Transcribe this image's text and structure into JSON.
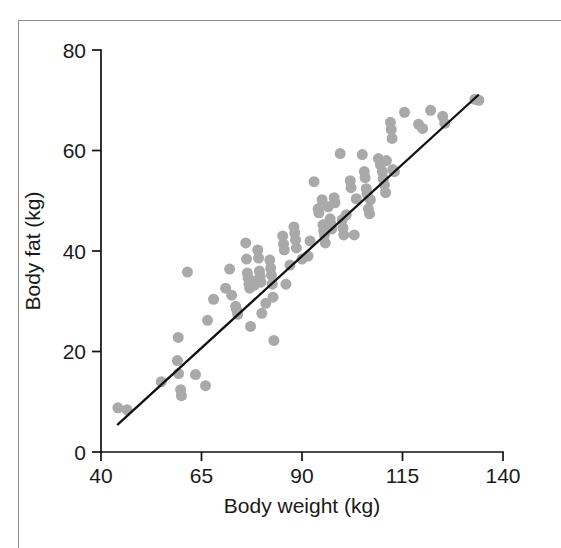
{
  "figure": {
    "background_color": "#ffffff",
    "frame_color": "#8c8c8c",
    "axis_color": "#111111"
  },
  "chart_data": {
    "type": "scatter",
    "title": "",
    "subtitle": "",
    "xlabel": "Body weight (kg)",
    "ylabel": "Body fat (kg)",
    "xlim": [
      40,
      140
    ],
    "ylim": [
      0,
      80
    ],
    "xticks": [
      40,
      65,
      90,
      115,
      140
    ],
    "yticks": [
      0,
      20,
      40,
      60,
      80
    ],
    "xtick_labels": [
      "40",
      "65",
      "90",
      "115",
      "140"
    ],
    "ytick_labels": [
      "0",
      "20",
      "40",
      "60",
      "80"
    ],
    "grid": false,
    "legend": null,
    "legend_position": "none",
    "marker": {
      "shape": "circle",
      "color": "#a9a9a9",
      "size_px": 11,
      "edge": "none"
    },
    "annotations": [],
    "series": [
      {
        "name": "Subjects",
        "marker_color": "#a9a9a9",
        "n_points": 104,
        "points": [
          [
            44.2,
            8.8
          ],
          [
            46.5,
            8.4
          ],
          [
            55.0,
            14.0
          ],
          [
            59.0,
            18.2
          ],
          [
            59.2,
            22.8
          ],
          [
            59.3,
            15.6
          ],
          [
            59.8,
            12.4
          ],
          [
            60.0,
            11.2
          ],
          [
            63.5,
            15.4
          ],
          [
            66.0,
            13.2
          ],
          [
            66.5,
            26.2
          ],
          [
            72.0,
            36.4
          ],
          [
            72.5,
            31.2
          ],
          [
            73.5,
            29.0
          ],
          [
            73.8,
            28.2
          ],
          [
            74.0,
            27.4
          ],
          [
            76.0,
            41.6
          ],
          [
            76.2,
            38.4
          ],
          [
            76.4,
            35.6
          ],
          [
            76.6,
            34.6
          ],
          [
            76.8,
            33.4
          ],
          [
            77.0,
            32.6
          ],
          [
            77.2,
            25.0
          ],
          [
            78.0,
            34.0
          ],
          [
            78.2,
            33.2
          ],
          [
            79.0,
            40.2
          ],
          [
            79.2,
            38.6
          ],
          [
            79.4,
            36.0
          ],
          [
            79.6,
            35.0
          ],
          [
            79.8,
            33.8
          ],
          [
            80.0,
            27.6
          ],
          [
            82.0,
            38.2
          ],
          [
            82.2,
            36.6
          ],
          [
            82.4,
            35.2
          ],
          [
            82.6,
            33.4
          ],
          [
            82.8,
            30.8
          ],
          [
            83.0,
            22.2
          ],
          [
            85.2,
            43.0
          ],
          [
            85.4,
            41.4
          ],
          [
            85.6,
            40.2
          ],
          [
            86.0,
            33.4
          ],
          [
            88.0,
            44.8
          ],
          [
            88.2,
            43.6
          ],
          [
            88.4,
            42.2
          ],
          [
            88.6,
            40.6
          ],
          [
            90.0,
            38.4
          ],
          [
            91.5,
            39.0
          ],
          [
            93.0,
            53.8
          ],
          [
            94.0,
            48.4
          ],
          [
            94.2,
            47.6
          ],
          [
            95.0,
            50.2
          ],
          [
            95.2,
            45.2
          ],
          [
            95.4,
            44.0
          ],
          [
            95.6,
            43.2
          ],
          [
            95.8,
            41.6
          ],
          [
            97.0,
            46.4
          ],
          [
            97.2,
            45.4
          ],
          [
            97.4,
            44.4
          ],
          [
            98.0,
            50.6
          ],
          [
            98.2,
            49.6
          ],
          [
            99.5,
            59.4
          ],
          [
            100.0,
            46.2
          ],
          [
            100.2,
            44.6
          ],
          [
            100.4,
            43.2
          ],
          [
            102.0,
            54.0
          ],
          [
            102.2,
            52.6
          ],
          [
            103.0,
            43.2
          ],
          [
            103.5,
            50.4
          ],
          [
            105.0,
            59.2
          ],
          [
            105.5,
            55.8
          ],
          [
            105.7,
            54.6
          ],
          [
            106.0,
            52.4
          ],
          [
            106.2,
            51.4
          ],
          [
            106.5,
            48.4
          ],
          [
            106.8,
            47.4
          ],
          [
            109.0,
            58.4
          ],
          [
            109.5,
            57.2
          ],
          [
            110.0,
            55.8
          ],
          [
            110.2,
            54.4
          ],
          [
            110.5,
            53.2
          ],
          [
            110.8,
            51.6
          ],
          [
            112.0,
            65.6
          ],
          [
            112.2,
            64.2
          ],
          [
            112.4,
            62.4
          ],
          [
            112.6,
            56.2
          ],
          [
            113.0,
            55.8
          ],
          [
            115.5,
            67.6
          ],
          [
            119.0,
            65.2
          ],
          [
            120.0,
            64.4
          ],
          [
            122.0,
            68.0
          ],
          [
            125.0,
            66.8
          ],
          [
            125.5,
            65.4
          ],
          [
            133.0,
            70.2
          ],
          [
            134.0,
            70.0
          ],
          [
            61.5,
            35.8
          ],
          [
            68.0,
            30.4
          ],
          [
            71.0,
            32.6
          ],
          [
            81.0,
            29.6
          ],
          [
            87.0,
            37.2
          ],
          [
            92.0,
            42.0
          ],
          [
            96.5,
            48.8
          ],
          [
            101.0,
            47.2
          ],
          [
            107.0,
            50.2
          ],
          [
            111.0,
            58.0
          ]
        ]
      }
    ],
    "fit_line": {
      "type": "linear-regression",
      "x_start": 44.2,
      "y_start": 5.5,
      "x_end": 133.8,
      "y_end": 71.0,
      "color": "#111111"
    }
  }
}
